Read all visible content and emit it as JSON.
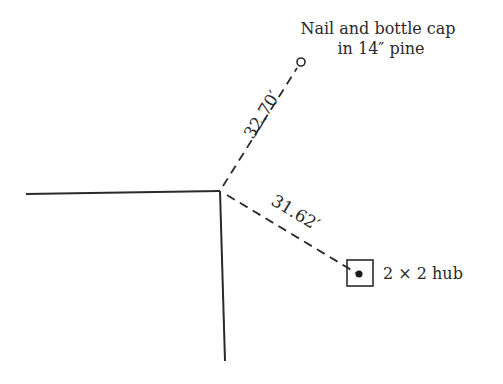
{
  "diagram": {
    "type": "survey-reference-tie",
    "corner": {
      "x": 220,
      "y": 191
    },
    "labels": {
      "nail_line1": "Nail and bottle cap",
      "nail_line2": "in 14″ pine",
      "hub": "2 × 2 hub",
      "distance_to_nail": "32.70′",
      "distance_to_hub": "31.62′"
    },
    "references": [
      {
        "name": "Nail and bottle cap in 14″ pine",
        "distance": "32.70′",
        "marker": "open-circle"
      },
      {
        "name": "2 × 2 hub",
        "distance": "31.62′",
        "marker": "square-with-dot"
      }
    ],
    "colors": {
      "ink": "#2a2a2a",
      "background": "#ffffff"
    }
  }
}
